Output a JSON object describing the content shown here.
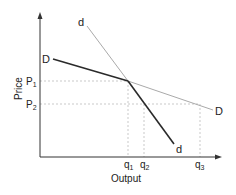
{
  "diagram": {
    "axes": {
      "y_label": "Price",
      "x_label": "Output"
    },
    "price_levels": [
      {
        "label": "P",
        "sub": "1"
      },
      {
        "label": "P",
        "sub": "2"
      }
    ],
    "quantity_levels": [
      {
        "label": "q",
        "sub": "1"
      },
      {
        "label": "q",
        "sub": "2"
      },
      {
        "label": "q",
        "sub": "3"
      }
    ],
    "curves": {
      "D_upper_label": "D",
      "D_lower_label": "D",
      "d_upper_label": "d",
      "d_lower_label": "d"
    },
    "colors": {
      "axis": "#333333",
      "dark_curve": "#2a2a2a",
      "light_curve": "#aaaaaa",
      "guide": "#bbbbbb"
    }
  }
}
